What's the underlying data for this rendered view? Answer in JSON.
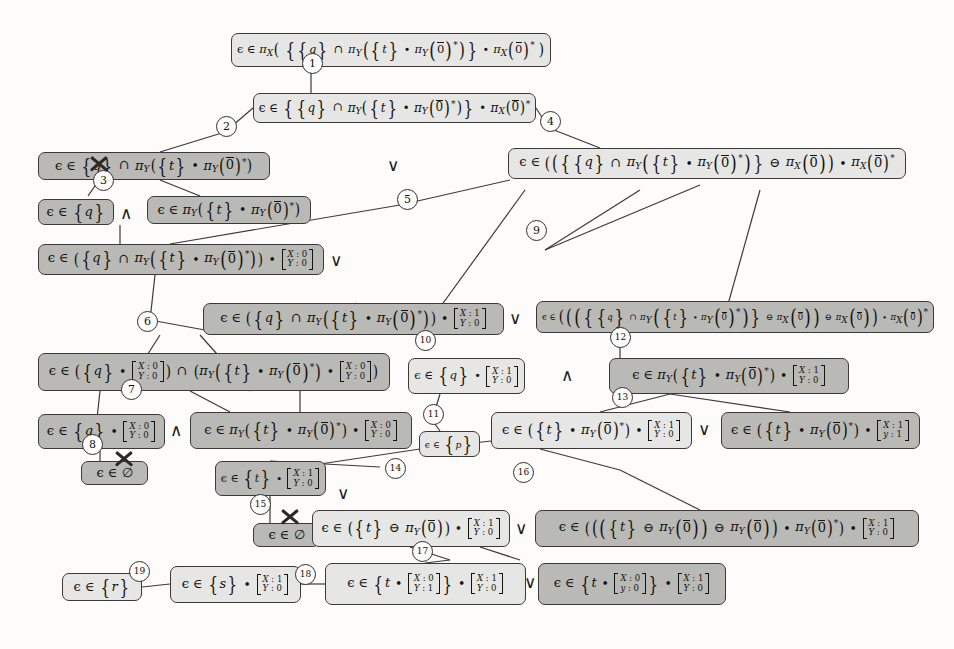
{
  "diagram": {
    "node_fill_light": "#e6e6e4",
    "node_fill_dark": "#b9b9b6",
    "border_color": "#3a3a3a",
    "nodes": [
      {
        "id": "n1",
        "shade": "light",
        "x": 231,
        "y": 33,
        "w": 320,
        "h": 34,
        "text": "ϵ ∈ π_X( {{q} ∩ π_Y({t} ∙ π_Y(0̄)*)} ∙ π_X(0̄)* )"
      },
      {
        "id": "n2",
        "shade": "light",
        "x": 253,
        "y": 93,
        "w": 283,
        "h": 30,
        "text": "ϵ ∈ {{q} ∩ π_Y({t} ∙ π_Y(0̄)*)} ∙ π_X(0̄)*"
      },
      {
        "id": "n3",
        "shade": "dark",
        "x": 38,
        "y": 152,
        "w": 232,
        "h": 28,
        "text": "ϵ ∈ {q} ∩ π_Y({t} ∙ π_Y(0̄)*)"
      },
      {
        "id": "n4",
        "shade": "light",
        "x": 508,
        "y": 148,
        "w": 398,
        "h": 31,
        "text": "ϵ ∈ (({{q} ∩ π_Y({t} ∙ π_Y(0̄)*)} ⊖ π_X(0̄)) ∙ π_X(0̄)*"
      },
      {
        "id": "n5",
        "shade": "dark",
        "x": 38,
        "y": 199,
        "w": 76,
        "h": 26,
        "text": "ϵ ∈ {q}"
      },
      {
        "id": "n6",
        "shade": "dark",
        "x": 147,
        "y": 196,
        "w": 164,
        "h": 28,
        "text": "ϵ ∈ π_Y({t} ∙ π_Y(0̄)*)"
      },
      {
        "id": "n7",
        "shade": "dark",
        "x": 38,
        "y": 244,
        "w": 286,
        "h": 31,
        "text": "ϵ ∈ ({q} ∩ π_Y({t} ∙ π_Y(0̄)*)) ∙ [X:0 / Y:0]"
      },
      {
        "id": "n8",
        "shade": "dark",
        "x": 203,
        "y": 303,
        "w": 301,
        "h": 32,
        "text": "ϵ ∈ ({q} ∩ π_Y({t} ∙ π_Y(0̄)*)) ∙ [X:1 / Y:0]"
      },
      {
        "id": "n9",
        "shade": "dark",
        "x": 536,
        "y": 301,
        "w": 398,
        "h": 32,
        "text": "ϵ ∈ ((({{q} ∩ π_Y({t} ∙ π_Y(0̄)*)} ⊖ π_X(0̄)) ⊖ π_X(0̄)) ∙ π_X(0̄)*"
      },
      {
        "id": "n10",
        "shade": "dark",
        "x": 38,
        "y": 353,
        "w": 352,
        "h": 38,
        "text": "ϵ ∈ ({q} ∙ [X:0 / Y:0]) ∩ (π_Y({t} ∙ π_Y(0̄)*) ∙ [X:0 / Y:0])"
      },
      {
        "id": "n11",
        "shade": "light",
        "x": 408,
        "y": 358,
        "w": 117,
        "h": 36,
        "text": "ϵ ∈ {q} ∙ [X:1 / Y:0]"
      },
      {
        "id": "n12",
        "shade": "dark",
        "x": 609,
        "y": 358,
        "w": 240,
        "h": 36,
        "text": "ϵ ∈ π_Y({t} ∙ π_Y(0̄)*) ∙ [X:1 / Y:0]"
      },
      {
        "id": "n13",
        "shade": "dark",
        "x": 38,
        "y": 414,
        "w": 127,
        "h": 35,
        "text": "ϵ ∈ {q} ∙ [X:0 / Y:0]"
      },
      {
        "id": "n14",
        "shade": "dark",
        "x": 190,
        "y": 412,
        "w": 222,
        "h": 37,
        "text": "ϵ ∈ π_Y({t} ∙ π_Y(0̄)*) ∙ [X:0 / Y:0]"
      },
      {
        "id": "n15",
        "shade": "light",
        "x": 419,
        "y": 431,
        "w": 61,
        "h": 26,
        "text": "ϵ ∈ {p}"
      },
      {
        "id": "n16",
        "shade": "light",
        "x": 491,
        "y": 412,
        "w": 201,
        "h": 37,
        "text": "ϵ ∈ ({t} ∙ π_Y(0̄)*) ∙ [X:1 / Y:0]"
      },
      {
        "id": "n17",
        "shade": "dark",
        "x": 721,
        "y": 412,
        "w": 199,
        "h": 37,
        "text": "ϵ ∈ ({t} ∙ π_Y(0̄)*) ∙ [X:1 / y:1]"
      },
      {
        "id": "n18",
        "shade": "dark",
        "x": 81,
        "y": 461,
        "w": 67,
        "h": 24,
        "text": "ϵ ∈ ∅"
      },
      {
        "id": "n19",
        "shade": "dark",
        "x": 215,
        "y": 461,
        "w": 111,
        "h": 35,
        "text": "ϵ ∈ {t} ∙ [X:1 / Y:0]"
      },
      {
        "id": "n20",
        "shade": "dark",
        "x": 253,
        "y": 523,
        "w": 67,
        "h": 24,
        "text": "ϵ ∈ ∅"
      },
      {
        "id": "n21",
        "shade": "light",
        "x": 312,
        "y": 510,
        "w": 198,
        "h": 37,
        "text": "ϵ ∈ ({t} ⊖ π_Y(0̄)) ∙ [X:1 / Y:0]"
      },
      {
        "id": "n22",
        "shade": "dark",
        "x": 535,
        "y": 510,
        "w": 384,
        "h": 37,
        "text": "ϵ ∈ ((({t} ⊖ π_Y(0̄)) ⊖ π_Y(0̄)) ∙ π_Y(0̄)*) ∙ [X:1 / Y:0]"
      },
      {
        "id": "n23",
        "shade": "light",
        "x": 62,
        "y": 573,
        "w": 80,
        "h": 28,
        "text": "ϵ ∈ {r}"
      },
      {
        "id": "n24",
        "shade": "light",
        "x": 170,
        "y": 566,
        "w": 131,
        "h": 37,
        "text": "ϵ ∈ {s} ∙ [X:1 / Y:0]"
      },
      {
        "id": "n25",
        "shade": "light",
        "x": 325,
        "y": 563,
        "w": 201,
        "h": 42,
        "text": "ϵ ∈ {t ∙ [X:0 / Y:1]} ∙ [X:1 / Y:0]"
      },
      {
        "id": "n26",
        "shade": "dark",
        "x": 538,
        "y": 563,
        "w": 188,
        "h": 42,
        "text": "ϵ ∈ {t ∙ [X:0 / y:0]} ∙ [X:1 / Y:0]"
      }
    ],
    "edge_labels": [
      {
        "id": "1",
        "x": 311,
        "y": 62
      },
      {
        "id": "2",
        "x": 225,
        "y": 125
      },
      {
        "id": "3",
        "x": 102,
        "y": 179
      },
      {
        "id": "4",
        "x": 549,
        "y": 120
      },
      {
        "id": "5",
        "x": 406,
        "y": 198
      },
      {
        "id": "6",
        "x": 146,
        "y": 320
      },
      {
        "id": "7",
        "x": 130,
        "y": 388
      },
      {
        "id": "8",
        "x": 91,
        "y": 443
      },
      {
        "id": "9",
        "x": 535,
        "y": 229
      },
      {
        "id": "10",
        "x": 424,
        "y": 339
      },
      {
        "id": "11",
        "x": 432,
        "y": 413
      },
      {
        "id": "12",
        "x": 619,
        "y": 336
      },
      {
        "id": "13",
        "x": 621,
        "y": 396
      },
      {
        "id": "14",
        "x": 394,
        "y": 467
      },
      {
        "id": "15",
        "x": 259,
        "y": 503
      },
      {
        "id": "16",
        "x": 522,
        "y": 471
      },
      {
        "id": "17",
        "x": 421,
        "y": 550
      },
      {
        "id": "18",
        "x": 304,
        "y": 573
      },
      {
        "id": "19",
        "x": 138,
        "y": 570
      }
    ],
    "connectives": [
      {
        "symbol": "∨",
        "x": 387,
        "y": 155
      },
      {
        "symbol": "∧",
        "x": 120,
        "y": 203
      },
      {
        "symbol": "∨",
        "x": 330,
        "y": 250
      },
      {
        "symbol": "∨",
        "x": 509,
        "y": 308
      },
      {
        "symbol": "∧",
        "x": 561,
        "y": 365
      },
      {
        "symbol": "∧",
        "x": 170,
        "y": 420
      },
      {
        "symbol": "∨",
        "x": 698,
        "y": 419
      },
      {
        "symbol": "∨",
        "x": 337,
        "y": 483
      },
      {
        "symbol": "∨",
        "x": 515,
        "y": 518
      },
      {
        "symbol": "∨",
        "x": 524,
        "y": 572
      }
    ],
    "x_marks": [
      {
        "x": 88,
        "y": 153
      },
      {
        "x": 113,
        "y": 448
      },
      {
        "x": 279,
        "y": 506
      }
    ],
    "edges": [
      [
        311,
        67,
        311,
        93
      ],
      [
        253,
        108,
        225,
        132
      ],
      [
        225,
        132,
        160,
        152
      ],
      [
        536,
        108,
        549,
        128
      ],
      [
        549,
        128,
        600,
        148
      ],
      [
        99,
        180,
        88,
        196
      ],
      [
        160,
        180,
        200,
        196
      ],
      [
        120,
        244,
        120,
        225
      ],
      [
        170,
        244,
        400,
        205
      ],
      [
        400,
        205,
        510,
        180
      ],
      [
        155,
        275,
        150,
        320
      ],
      [
        150,
        320,
        205,
        330
      ],
      [
        355,
        303,
        420,
        335
      ],
      [
        420,
        335,
        525,
        190
      ],
      [
        545,
        250,
        700,
        185
      ],
      [
        545,
        250,
        640,
        190
      ],
      [
        160,
        335,
        130,
        382
      ],
      [
        130,
        382,
        120,
        391
      ],
      [
        200,
        335,
        250,
        391
      ],
      [
        620,
        333,
        620,
        358
      ],
      [
        720,
        333,
        760,
        190
      ],
      [
        100,
        391,
        95,
        437
      ],
      [
        190,
        391,
        230,
        412
      ],
      [
        300,
        391,
        300,
        412
      ],
      [
        100,
        449,
        100,
        461
      ],
      [
        440,
        394,
        432,
        420
      ],
      [
        432,
        420,
        440,
        431
      ],
      [
        670,
        394,
        600,
        412
      ],
      [
        670,
        394,
        790,
        412
      ],
      [
        380,
        467,
        270,
        461
      ],
      [
        270,
        449,
        270,
        412
      ],
      [
        270,
        496,
        270,
        523
      ],
      [
        300,
        467,
        420,
        449
      ],
      [
        420,
        449,
        500,
        440
      ],
      [
        540,
        449,
        620,
        470
      ],
      [
        620,
        470,
        700,
        510
      ],
      [
        410,
        547,
        450,
        560
      ],
      [
        450,
        560,
        425,
        563
      ],
      [
        142,
        587,
        170,
        584
      ],
      [
        301,
        584,
        325,
        584
      ],
      [
        480,
        547,
        520,
        560
      ]
    ]
  }
}
